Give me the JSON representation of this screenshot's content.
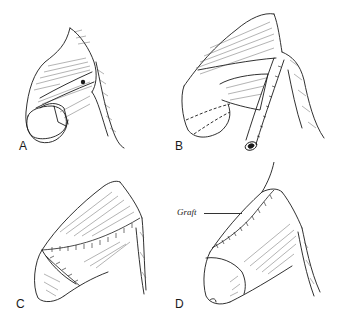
{
  "figure": {
    "type": "surgical-illustration",
    "panels": [
      {
        "id": "A",
        "label": "A"
      },
      {
        "id": "B",
        "label": "B"
      },
      {
        "id": "C",
        "label": "C"
      },
      {
        "id": "D",
        "label": "D"
      }
    ],
    "annotations": {
      "graft": "Graft"
    },
    "colors": {
      "ink": "#1a1a1a",
      "background": "#ffffff"
    }
  }
}
